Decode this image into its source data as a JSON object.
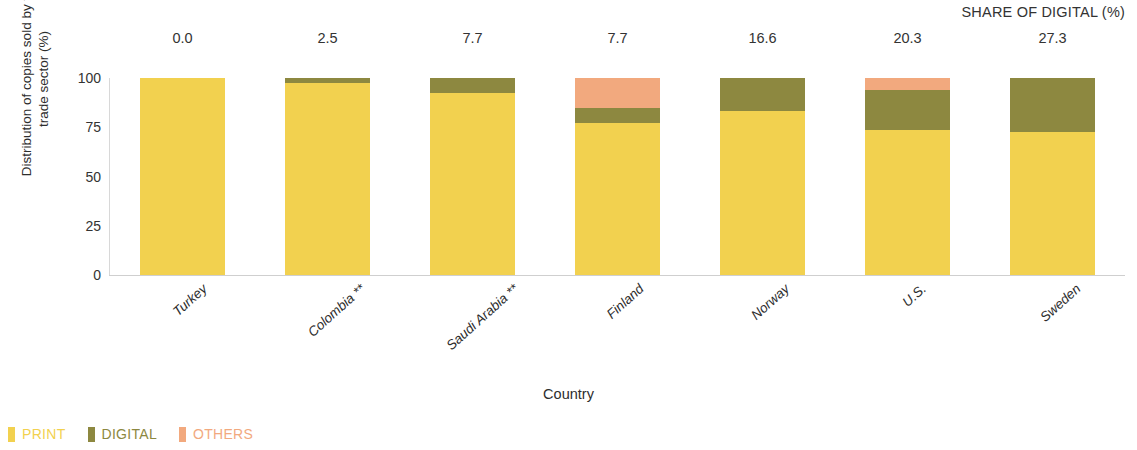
{
  "header": {
    "share_title": "SHARE OF DIGITAL (%)"
  },
  "axes": {
    "y_title": "Distribution of copies sold by the trade sector (%)",
    "x_title": "Country"
  },
  "legend": {
    "items": [
      {
        "label": "PRINT",
        "color": "#f2d14f"
      },
      {
        "label": "DIGITAL",
        "color": "#8d8840"
      },
      {
        "label": "OTHERS",
        "color": "#f2a97e"
      }
    ]
  },
  "chart_data": {
    "type": "bar",
    "subtype": "stacked-bar-100",
    "title": "",
    "subtitle": "",
    "xlabel": "Country",
    "ylabel": "Distribution of copies sold by the trade sector (%)",
    "ylim": [
      0,
      100
    ],
    "yticks": [
      0,
      25,
      50,
      75,
      100
    ],
    "ytick_labels": [
      "0",
      "25",
      "50",
      "75",
      "100"
    ],
    "grid": false,
    "legend_position": "bottom-left",
    "categories": [
      "Turkey",
      "Colombia **",
      "Saudi Arabia **",
      "Finland",
      "Norway",
      "U.S.",
      "Sweden"
    ],
    "series": [
      {
        "name": "PRINT",
        "color": "#f2d14f",
        "values": [
          100.0,
          97.5,
          92.3,
          77.3,
          83.4,
          73.7,
          72.7
        ]
      },
      {
        "name": "DIGITAL",
        "color": "#8d8840",
        "values": [
          0.0,
          2.5,
          7.7,
          7.7,
          16.6,
          20.3,
          27.3
        ]
      },
      {
        "name": "OTHERS",
        "color": "#f2a97e",
        "values": [
          0.0,
          0.0,
          0.0,
          15.0,
          0.0,
          6.0,
          0.0
        ]
      }
    ],
    "annotations": {
      "label": "SHARE OF DIGITAL (%)",
      "values": [
        "0.0",
        "2.5",
        "7.7",
        "7.7",
        "16.6",
        "20.3",
        "27.3"
      ]
    }
  }
}
